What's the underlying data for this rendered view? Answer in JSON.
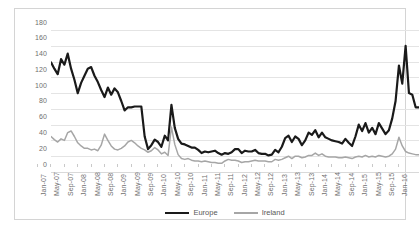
{
  "chart_data": {
    "type": "line",
    "title": "",
    "subtitle": "",
    "xlabel": "",
    "ylabel": "",
    "ylim": [
      0,
      180
    ],
    "yticks": [
      0,
      20,
      40,
      60,
      80,
      100,
      120,
      140,
      160,
      180
    ],
    "grid": true,
    "legend_position": "bottom",
    "x_tick_labels": [
      "Jan-07",
      "May-07",
      "Sep-07",
      "Jan-08",
      "May-08",
      "Sep-08",
      "Jan-09",
      "May-09",
      "Sep-09",
      "Jan-10",
      "May-10",
      "Sep-10",
      "Jan-11",
      "May-11",
      "Sep-11",
      "Jan-12",
      "May-12",
      "Sep-12",
      "Jan-13",
      "May-13",
      "Sep-13",
      "Jan-14",
      "May-14",
      "Sep-14",
      "Jan-15",
      "May-15",
      "Sep-15",
      "Jan-16"
    ],
    "x_tick_interval_months": 4,
    "x_start": "Jan-07",
    "x_end": "Mar-16",
    "x": [
      "Jan-07",
      "Feb-07",
      "Mar-07",
      "Apr-07",
      "May-07",
      "Jun-07",
      "Jul-07",
      "Aug-07",
      "Sep-07",
      "Oct-07",
      "Nov-07",
      "Dec-07",
      "Jan-08",
      "Feb-08",
      "Mar-08",
      "Apr-08",
      "May-08",
      "Jun-08",
      "Jul-08",
      "Aug-08",
      "Sep-08",
      "Oct-08",
      "Nov-08",
      "Dec-08",
      "Jan-09",
      "Feb-09",
      "Mar-09",
      "Apr-09",
      "May-09",
      "Jun-09",
      "Jul-09",
      "Aug-09",
      "Sep-09",
      "Oct-09",
      "Nov-09",
      "Dec-09",
      "Jan-10",
      "Feb-10",
      "Mar-10",
      "Apr-10",
      "May-10",
      "Jun-10",
      "Jul-10",
      "Aug-10",
      "Sep-10",
      "Oct-10",
      "Nov-10",
      "Dec-10",
      "Jan-11",
      "Feb-11",
      "Mar-11",
      "Apr-11",
      "May-11",
      "Jun-11",
      "Jul-11",
      "Aug-11",
      "Sep-11",
      "Oct-11",
      "Nov-11",
      "Dec-11",
      "Jan-12",
      "Feb-12",
      "Mar-12",
      "Apr-12",
      "May-12",
      "Jun-12",
      "Jul-12",
      "Aug-12",
      "Sep-12",
      "Oct-12",
      "Nov-12",
      "Dec-12",
      "Jan-13",
      "Feb-13",
      "Mar-13",
      "Apr-13",
      "May-13",
      "Jun-13",
      "Jul-13",
      "Aug-13",
      "Sep-13",
      "Oct-13",
      "Nov-13",
      "Dec-13",
      "Jan-14",
      "Feb-14",
      "Mar-14",
      "Apr-14",
      "May-14",
      "Jun-14",
      "Jul-14",
      "Aug-14",
      "Sep-14",
      "Oct-14",
      "Nov-14",
      "Dec-14",
      "Jan-15",
      "Feb-15",
      "Mar-15",
      "Apr-15",
      "May-15",
      "Jun-15",
      "Jul-15",
      "Aug-15",
      "Sep-15",
      "Oct-15",
      "Nov-15",
      "Dec-15",
      "Jan-16",
      "Feb-16",
      "Mar-16"
    ],
    "series": [
      {
        "name": "Europe",
        "color": "#1a1a1a",
        "line_width": 2.2,
        "values": [
          139,
          131,
          124,
          143,
          136,
          150,
          131,
          117,
          100,
          113,
          122,
          131,
          133,
          122,
          114,
          104,
          95,
          107,
          98,
          106,
          101,
          90,
          78,
          82,
          82,
          83,
          83,
          83,
          45,
          29,
          34,
          41,
          38,
          32,
          46,
          40,
          85,
          56,
          42,
          36,
          35,
          33,
          31,
          31,
          28,
          24,
          26,
          25,
          26,
          27,
          24,
          22,
          24,
          23,
          25,
          29,
          29,
          24,
          27,
          26,
          26,
          28,
          24,
          23,
          23,
          21,
          22,
          28,
          25,
          32,
          43,
          46,
          38,
          45,
          42,
          34,
          40,
          50,
          47,
          53,
          44,
          50,
          44,
          42,
          40,
          39,
          38,
          36,
          42,
          37,
          33,
          45,
          60,
          52,
          62,
          50,
          56,
          48,
          62,
          55,
          48,
          53,
          68,
          90,
          135,
          112,
          160,
          100,
          98,
          82,
          82
        ]
      },
      {
        "name": "Ireland",
        "color": "#a6a6a6",
        "line_width": 1.5,
        "values": [
          45,
          41,
          38,
          42,
          40,
          50,
          52,
          45,
          37,
          33,
          30,
          30,
          28,
          29,
          27,
          34,
          48,
          40,
          33,
          29,
          28,
          30,
          33,
          38,
          40,
          37,
          33,
          30,
          28,
          25,
          27,
          31,
          28,
          23,
          25,
          21,
          57,
          35,
          22,
          17,
          16,
          17,
          15,
          14,
          14,
          13,
          14,
          13,
          12,
          12,
          11,
          11,
          14,
          16,
          15,
          15,
          14,
          12,
          13,
          13,
          14,
          15,
          14,
          14,
          14,
          13,
          13,
          16,
          15,
          16,
          18,
          20,
          17,
          20,
          20,
          18,
          19,
          21,
          21,
          24,
          21,
          23,
          20,
          19,
          19,
          19,
          18,
          18,
          19,
          18,
          17,
          19,
          20,
          19,
          21,
          19,
          20,
          19,
          21,
          20,
          19,
          20,
          23,
          29,
          44,
          33,
          26,
          24,
          23,
          22,
          22
        ]
      }
    ]
  },
  "legend": {
    "items": [
      {
        "label": "Europe",
        "color": "#1a1a1a"
      },
      {
        "label": "Ireland",
        "color": "#a6a6a6"
      }
    ]
  },
  "colors": {
    "europe": "#1a1a1a",
    "ireland": "#a6a6a6",
    "gridline": "#e4e4e4",
    "tick_text": "#6f6f6f",
    "frame_border": "#d4d4d4",
    "background": "#ffffff"
  }
}
